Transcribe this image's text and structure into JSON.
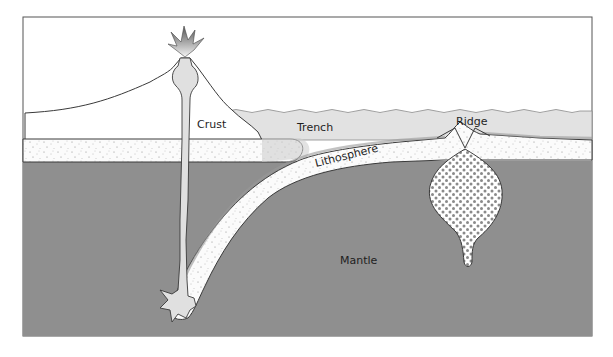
{
  "diagram": {
    "labels": {
      "crust": "Crust",
      "trench": "Trench",
      "ridge": "Ridge",
      "lithosphere": "Lithosphere",
      "mantle": "Mantle"
    },
    "colors": {
      "mantle": "#8f8f8f",
      "water": "#e2e2e2",
      "lithosphere": "#fbfbfb",
      "magma": "#dcdcdc",
      "outline": "#3a3a3a",
      "plume_dots": "#8a8a8a",
      "sky": "#ffffff"
    }
  }
}
